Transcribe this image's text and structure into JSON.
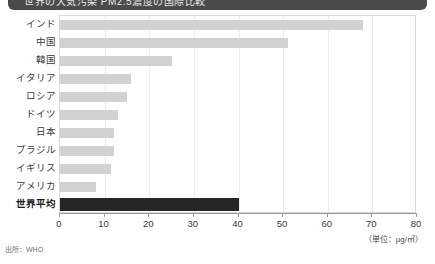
{
  "banner": {
    "text": "世界の大気汚染 PM2.5濃度の国際比較"
  },
  "source": {
    "label": "出所：WHO"
  },
  "unit": {
    "label": "（単位：μg/㎥）"
  },
  "colors": {
    "bar": "#d2d2d2",
    "highlight": "#262626",
    "banner": "#4a4a4a",
    "frame": "#d8d8d8",
    "grid": "#ececec",
    "axis": "#9a9a9a"
  },
  "chart_data": {
    "type": "bar",
    "orientation": "horizontal",
    "title": "",
    "xlabel": "（単位：μg/㎥）",
    "ylabel": "",
    "xlim": [
      0,
      80
    ],
    "xticks": [
      0,
      10,
      20,
      30,
      40,
      50,
      60,
      70,
      80
    ],
    "grid": true,
    "legend": false,
    "categories": [
      "インド",
      "中国",
      "韓国",
      "イタリア",
      "ロシア",
      "ドイツ",
      "日本",
      "ブラジル",
      "イギリス",
      "アメリカ",
      "世界平均"
    ],
    "values": [
      68,
      51,
      25,
      16,
      15,
      13,
      12,
      12,
      11.5,
      8,
      40
    ],
    "highlight_index": 10,
    "annotations": [
      "出所：WHO"
    ]
  }
}
